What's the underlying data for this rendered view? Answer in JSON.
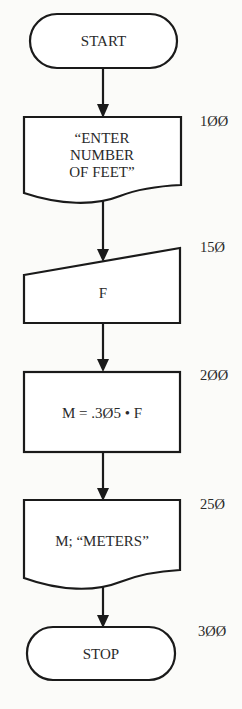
{
  "diagram": {
    "type": "flowchart",
    "nodes": [
      {
        "id": "start",
        "shape": "terminal",
        "text": "START",
        "line_number": ""
      },
      {
        "id": "prompt",
        "shape": "document",
        "lines": [
          "“ENTER",
          "NUMBER",
          "OF FEET”"
        ],
        "line_number": "1ØØ"
      },
      {
        "id": "input",
        "shape": "manual-input",
        "text": "F",
        "line_number": "15Ø"
      },
      {
        "id": "compute",
        "shape": "process",
        "text": "M = .3Ø5 • F",
        "line_number": "2ØØ"
      },
      {
        "id": "output",
        "shape": "document",
        "text": "M; “METERS”",
        "line_number": "25Ø"
      },
      {
        "id": "stop",
        "shape": "terminal",
        "text": "STOP",
        "line_number": "3ØØ"
      }
    ],
    "edges": [
      {
        "from": "start",
        "to": "prompt"
      },
      {
        "from": "prompt",
        "to": "input"
      },
      {
        "from": "input",
        "to": "compute"
      },
      {
        "from": "compute",
        "to": "output"
      },
      {
        "from": "output",
        "to": "stop"
      }
    ]
  }
}
